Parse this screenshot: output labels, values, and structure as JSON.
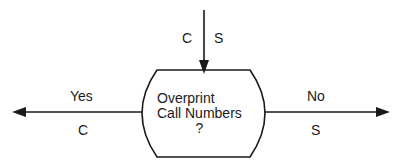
{
  "decision": {
    "line1": "Overprint",
    "line2": "Call Numbers",
    "line3": "?"
  },
  "incoming": {
    "left_label": "C",
    "right_label": "S"
  },
  "branches": {
    "yes": {
      "label": "Yes",
      "sub_label": "C"
    },
    "no": {
      "label": "No",
      "sub_label": "S"
    }
  }
}
